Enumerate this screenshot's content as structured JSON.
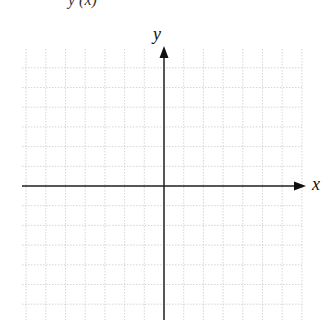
{
  "diagram": {
    "type": "coordinate-plane",
    "title_fragment": "y (x)",
    "axes": {
      "x_label": "x",
      "y_label": "y"
    },
    "grid": {
      "left": 22,
      "top": 49,
      "right": 302,
      "bottom": 320,
      "cell": 19.7,
      "line_color": "#cccccc",
      "style": "dotted"
    },
    "origin": {
      "x": 164,
      "y": 186
    },
    "axis_color": "#222222"
  }
}
